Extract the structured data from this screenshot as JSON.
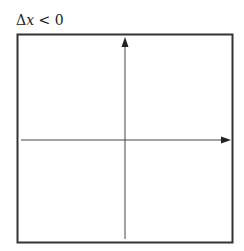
{
  "diagram": {
    "label": "Δx < 0",
    "label_parts": {
      "delta": "Δ",
      "var": "x",
      "rel": " < 0"
    },
    "frame": {
      "x": 17,
      "y": 34,
      "width": 216,
      "height": 209,
      "stroke": "#333333"
    },
    "axes": {
      "vertical": {
        "x": 125,
        "y_start": 239,
        "y_end": 38,
        "arrow": "up"
      },
      "horizontal": {
        "y": 140,
        "x_start": 21,
        "x_end": 230,
        "arrow": "right"
      },
      "stroke": "#444444"
    }
  }
}
